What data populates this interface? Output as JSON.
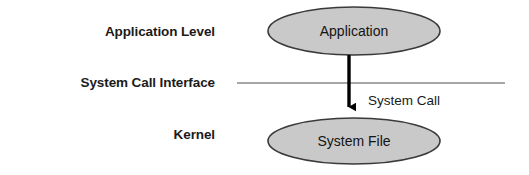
{
  "diagram": {
    "type": "layered-flow-diagram",
    "background_color": "#ffffff",
    "tiers": [
      {
        "id": "application-level",
        "label": "Application Level"
      },
      {
        "id": "system-call-interface",
        "label": "System Call Interface"
      },
      {
        "id": "kernel",
        "label": "Kernel"
      }
    ],
    "nodes": [
      {
        "id": "application",
        "label": "Application",
        "shape": "ellipse",
        "tier": "application-level",
        "fill_color": "#c9c9c9",
        "stroke_color": "#3a3a3a",
        "cx": 354,
        "cy": 31,
        "rx": 86,
        "ry": 24
      },
      {
        "id": "system-file",
        "label": "System File",
        "shape": "ellipse",
        "tier": "kernel",
        "fill_color": "#c9c9c9",
        "stroke_color": "#3a3a3a",
        "cx": 354,
        "cy": 141,
        "rx": 86,
        "ry": 23
      }
    ],
    "edges": [
      {
        "id": "system-call",
        "label": "System Call",
        "from": "application",
        "to": "system-file",
        "direction": "down",
        "color": "#000000",
        "label_x": 368,
        "label_y": 105
      }
    ],
    "separator": {
      "id": "system-call-interface-line",
      "orientation": "horizontal",
      "color": "#8a8a8a",
      "x1": 237,
      "x2": 505,
      "y": 83
    }
  }
}
